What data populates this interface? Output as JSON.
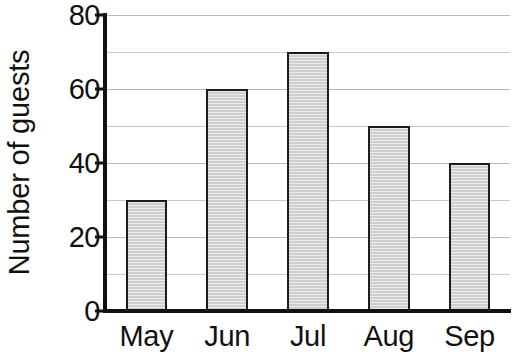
{
  "chart_data": {
    "type": "bar",
    "title": "",
    "xlabel": "",
    "ylabel": "Number of guests",
    "categories": [
      "May",
      "Jun",
      "Jul",
      "Aug",
      "Sep"
    ],
    "values": [
      30,
      60,
      70,
      50,
      40
    ],
    "ylim": [
      0,
      80
    ],
    "y_major_ticks": [
      0,
      20,
      40,
      60,
      80
    ],
    "y_tick_labels": [
      "0",
      "20",
      "40",
      "60",
      "80"
    ],
    "y_minor_gridlines": [
      10,
      30,
      50,
      70
    ],
    "grid": true,
    "grid_axis": "y",
    "legend": false,
    "legend_position": "none",
    "bar_fill_color": "#d6d6d6",
    "bar_edge_color": "#1c1c1c",
    "axis_color": "#111111",
    "gridline_color": "#b9b9b9",
    "background_color": "#ffffff",
    "series": [
      {
        "name": "Number of guests",
        "values": [
          30,
          60,
          70,
          50,
          40
        ]
      }
    ],
    "points": [
      {
        "category": "May",
        "value": 30
      },
      {
        "category": "Jun",
        "value": 60
      },
      {
        "category": "Jul",
        "value": 70
      },
      {
        "category": "Aug",
        "value": 50
      },
      {
        "category": "Sep",
        "value": 40
      }
    ]
  }
}
